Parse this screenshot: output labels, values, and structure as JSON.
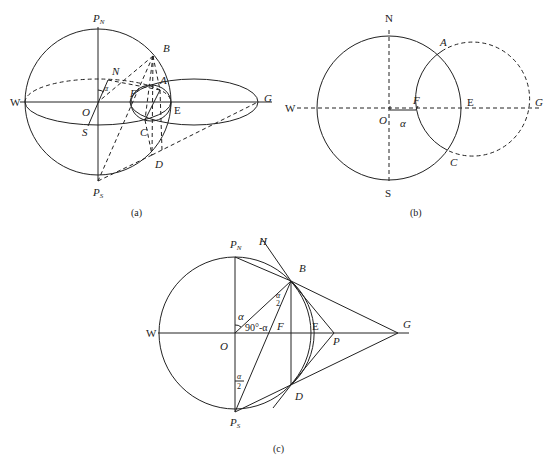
{
  "figure": {
    "panels": [
      {
        "id": "a",
        "caption": "(a)",
        "labels": {
          "pn": "P",
          "pn_sub": "N",
          "ps": "P",
          "ps_sub": "S",
          "w": "W",
          "e": "E",
          "o": "O",
          "n": "N",
          "s": "S",
          "a": "A",
          "b": "B",
          "c": "C",
          "d": "D",
          "f": "F",
          "g": "G",
          "angle": "α"
        }
      },
      {
        "id": "b",
        "caption": "(b)",
        "labels": {
          "n": "N",
          "s": "S",
          "w": "W",
          "e": "E",
          "o": "O",
          "a": "A",
          "c": "C",
          "f": "F",
          "g": "G",
          "alpha": "α"
        }
      },
      {
        "id": "c",
        "caption": "(c)",
        "labels": {
          "pn": "P",
          "pn_sub": "N",
          "ps": "P",
          "ps_sub": "S",
          "w": "W",
          "e": "E",
          "o": "O",
          "f": "F",
          "g": "G",
          "b": "B",
          "d": "D",
          "h": "H",
          "p": "P",
          "alpha": "α",
          "complement": "90°-α",
          "half_num": "α",
          "half_den": "2"
        }
      }
    ]
  }
}
